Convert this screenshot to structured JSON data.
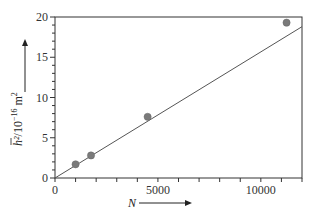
{
  "chart_data": {
    "type": "scatter",
    "title": "",
    "xlabel": "N",
    "ylabel_parts": {
      "symbol": "h²",
      "unit": "/10",
      "exp": "−16",
      "tail": " m",
      "tail_exp": "2"
    },
    "xlim": [
      0,
      12000
    ],
    "ylim": [
      0,
      20
    ],
    "x_ticks": [
      0,
      5000,
      10000
    ],
    "x_tick_labels": [
      "0",
      "5000",
      "10000"
    ],
    "x_minor_step": 1000,
    "y_ticks": [
      0,
      5,
      10,
      15,
      20
    ],
    "y_tick_labels": [
      "0",
      "5",
      "10",
      "15",
      "20"
    ],
    "y_minor_step": 1,
    "grid": false,
    "series": [
      {
        "name": "measured",
        "marker": "circle",
        "color": "#7a7a7a",
        "points": [
          {
            "x": 1000,
            "y": 1.7
          },
          {
            "x": 1750,
            "y": 2.8
          },
          {
            "x": 4500,
            "y": 7.6
          },
          {
            "x": 11250,
            "y": 19.3
          }
        ]
      },
      {
        "name": "fit",
        "type": "line",
        "color": "#555555",
        "points": [
          {
            "x": 0,
            "y": 0
          },
          {
            "x": 12000,
            "y": 18.8
          }
        ]
      }
    ]
  }
}
